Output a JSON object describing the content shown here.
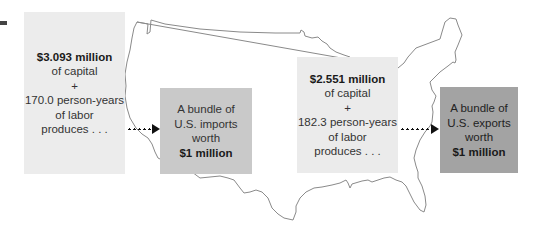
{
  "diagram": {
    "imports_side": {
      "input_box": {
        "capital_amount": "$3.093 million",
        "capital_label": "of capital",
        "plus": "+",
        "labor_amount": "170.0 person-years",
        "labor_label": "of labor",
        "verb": "produces . . ."
      },
      "output_box": {
        "line1": "A bundle of",
        "line2": "U.S. imports",
        "line3": "worth",
        "value": "$1 million"
      }
    },
    "exports_side": {
      "input_box": {
        "capital_amount": "$2.551 million",
        "capital_label": "of capital",
        "plus": "+",
        "labor_amount": "182.3 person-years",
        "labor_label": "of labor",
        "verb": "produces . . ."
      },
      "output_box": {
        "line1": "A bundle of",
        "line2": "U.S. exports",
        "line3": "worth",
        "value": "$1 million"
      }
    },
    "background": "us-map-outline",
    "colors": {
      "input_box": "#ececec",
      "imports_box": "#c9c9c9",
      "exports_box": "#a3a3a3",
      "map_stroke": "#8a8a8a",
      "arrow": "#111111"
    }
  }
}
